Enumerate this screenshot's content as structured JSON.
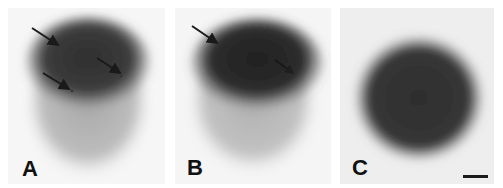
{
  "figure": {
    "panels": [
      {
        "label": "A",
        "arrow_count": 3
      },
      {
        "label": "B",
        "arrow_count": 2
      },
      {
        "label": "C",
        "arrow_count": 0,
        "has_scale_bar": true
      }
    ]
  },
  "colors": {
    "dark_region": "#2e2e2e",
    "light_region": "#b5b5b5",
    "background": "#f4f4f4",
    "arrow": "#1a1a1a"
  }
}
